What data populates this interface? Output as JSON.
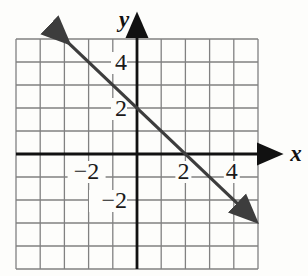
{
  "chart_data": {
    "type": "line",
    "title": "",
    "xlabel": "x",
    "ylabel": "y",
    "xlim": [
      -5,
      5
    ],
    "ylim": [
      -5,
      5
    ],
    "grid": true,
    "grid_step": 1,
    "x_tick_labels": [
      {
        "value": -2,
        "label": "−2"
      },
      {
        "value": 2,
        "label": "2"
      },
      {
        "value": 4,
        "label": "4"
      }
    ],
    "y_tick_labels": [
      {
        "value": 4,
        "label": "4"
      },
      {
        "value": 2,
        "label": "2"
      },
      {
        "value": -2,
        "label": "−2"
      }
    ],
    "series": [
      {
        "name": "line-through-(0,2)-and-(2,0)",
        "equation": "y = -x + 2",
        "slope": -1,
        "y_intercept": 2,
        "x_intercept": 2,
        "points": [
          [
            -2.9,
            4.9
          ],
          [
            0,
            2
          ],
          [
            2,
            0
          ],
          [
            4.85,
            -2.85
          ]
        ],
        "endpoints": [
          [
            -2.9,
            4.9
          ],
          [
            4.85,
            -2.85
          ]
        ],
        "arrows": "both",
        "color": "#3d3d3d"
      }
    ],
    "colors": {
      "grid": "#818181",
      "axis": "#111111",
      "background": "#fdfdfb",
      "text": "#1a1a1a"
    },
    "legend": null
  }
}
